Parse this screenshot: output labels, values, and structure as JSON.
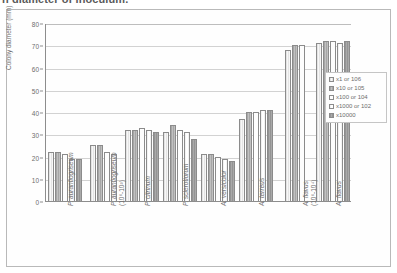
{
  "caption": {
    "text": "n diameter of inoculum."
  },
  "legend": {
    "position": "right-inside",
    "entries": [
      {
        "label": "x1 or 106",
        "swatch": "s0"
      },
      {
        "label": "x10 or 105",
        "swatch": "s1"
      },
      {
        "label": "x100 or 104",
        "swatch": "s2"
      },
      {
        "label": "x1000 or 102",
        "swatch": "s3"
      },
      {
        "label": "x10000",
        "swatch": "s4"
      }
    ]
  },
  "chart_data": {
    "type": "bar",
    "title": "",
    "xlabel": "",
    "ylabel": "Colony diameter (mm)",
    "ylim": [
      0,
      80
    ],
    "yticks": [
      0,
      10,
      20,
      30,
      40,
      50,
      60,
      70,
      80
    ],
    "grid": true,
    "categories": [
      "P. aurantiogriseum",
      "P. aurantiogriseum (10⁶-10³)",
      "P. citrinum",
      "P. sclerotiorum",
      "A. versicolor",
      "A. terreus",
      "A. flavus (10⁶-10⁴)",
      "A. flavus"
    ],
    "category_lines": [
      [
        "P. aurantiogriseum"
      ],
      [
        "P. aurantiogriseum",
        "(10⁶-10³)"
      ],
      [
        "P. citrinum"
      ],
      [
        "P. sclerotiorum"
      ],
      [
        "A. versicolor"
      ],
      [
        "A. terreus"
      ],
      [
        "A. flavus",
        "(10⁶-10⁴)"
      ],
      [
        "A. flavus"
      ]
    ],
    "series": [
      {
        "name": "x1 or 106",
        "values": [
          22,
          25,
          32,
          31,
          21,
          37,
          68,
          71
        ]
      },
      {
        "name": "x10 or 105",
        "values": [
          22,
          25,
          32,
          34,
          21,
          40,
          70,
          72
        ]
      },
      {
        "name": "x100 or 104",
        "values": [
          21,
          22,
          33,
          32,
          20,
          40,
          70,
          72
        ]
      },
      {
        "name": "x1000 or 102",
        "values": [
          19,
          21,
          32,
          31,
          19,
          41,
          null,
          71
        ]
      },
      {
        "name": "x10000",
        "values": [
          19,
          null,
          31,
          28,
          18,
          41,
          null,
          72
        ]
      }
    ]
  }
}
